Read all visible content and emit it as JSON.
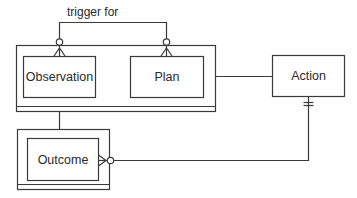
{
  "diagram": {
    "type": "entity-relationship",
    "colors": {
      "stroke": "#3a3a3a",
      "background": "#ffffff",
      "text": "#2a2a2a"
    },
    "relationship_label": "trigger for",
    "entities": [
      {
        "id": "observation",
        "label": "Observation",
        "group": "observation-plan-group"
      },
      {
        "id": "plan",
        "label": "Plan",
        "group": "observation-plan-group"
      },
      {
        "id": "action",
        "label": "Action"
      },
      {
        "id": "outcome",
        "label": "Outcome"
      }
    ],
    "relationships": [
      {
        "from": "observation",
        "to": "plan",
        "label": "trigger for",
        "ends": [
          "zero-or-many",
          "zero-or-many"
        ]
      },
      {
        "from": "observation-plan-group",
        "to": "action",
        "ends": [
          "none",
          "none"
        ]
      },
      {
        "from": "observation-plan-group",
        "to": "outcome",
        "ends": [
          "none",
          "none"
        ]
      },
      {
        "from": "action",
        "to": "outcome",
        "ends": [
          "exactly-one",
          "zero-or-many"
        ]
      }
    ]
  }
}
